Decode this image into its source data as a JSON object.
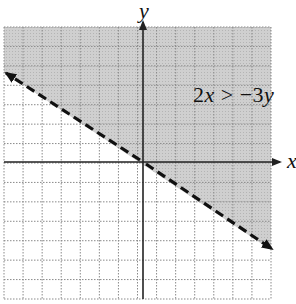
{
  "chart_data": {
    "type": "inequality-graph",
    "title": "",
    "xlabel": "x",
    "ylabel": "y",
    "annotation": "2x > −3y",
    "inequality": {
      "lhs": "2x",
      "op": ">",
      "rhs": "−3y"
    },
    "boundary_line": {
      "equation": "y = −(2/3)x",
      "slope": -0.6667,
      "intercept": 0,
      "style": "dashed",
      "arrows": "both ends"
    },
    "shaded_region": "above boundary line",
    "grid": true,
    "grid_style": "dotted",
    "xlim": [
      -7,
      7
    ],
    "ylim": [
      -7,
      7
    ],
    "tick_labels": false
  },
  "labels": {
    "x_axis": "x",
    "y_axis": "y",
    "inequality_prefix": "2",
    "inequality_var1": "x",
    "inequality_mid": " > −3",
    "inequality_var2": "y"
  },
  "colors": {
    "shade": "#c8c8c8",
    "grid": "#8a8a8a",
    "axis": "#222222",
    "boundary": "#111111",
    "background": "#ffffff"
  }
}
